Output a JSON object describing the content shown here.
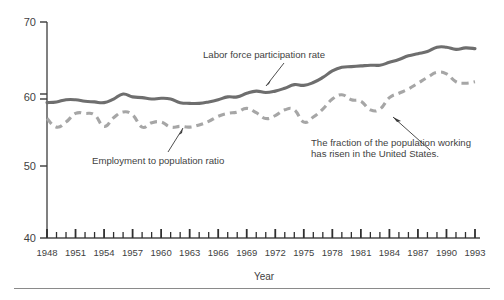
{
  "chart_data": {
    "type": "line",
    "title": "",
    "xlabel": "Year",
    "ylabel": "",
    "xlim": [
      1948,
      1993
    ],
    "ylim": [
      40,
      70
    ],
    "yticks": [
      40,
      50,
      60,
      70
    ],
    "xticks": [
      1948,
      1951,
      1954,
      1957,
      1960,
      1963,
      1966,
      1969,
      1972,
      1975,
      1978,
      1981,
      1984,
      1987,
      1990,
      1993
    ],
    "x_minor_tick_interval": 1,
    "grid": false,
    "legend_position": "none",
    "x": [
      1948,
      1949,
      1950,
      1951,
      1952,
      1953,
      1954,
      1955,
      1956,
      1957,
      1958,
      1959,
      1960,
      1961,
      1962,
      1963,
      1964,
      1965,
      1966,
      1967,
      1968,
      1969,
      1970,
      1971,
      1972,
      1973,
      1974,
      1975,
      1976,
      1977,
      1978,
      1979,
      1980,
      1981,
      1982,
      1983,
      1984,
      1985,
      1986,
      1987,
      1988,
      1989,
      1990,
      1991,
      1992,
      1993
    ],
    "series": [
      {
        "name": "Labor force participation rate",
        "style": "solid",
        "color": "#6e6e6e",
        "values": [
          58.8,
          58.9,
          59.2,
          59.2,
          59.0,
          58.9,
          58.8,
          59.3,
          60.0,
          59.6,
          59.5,
          59.3,
          59.4,
          59.3,
          58.8,
          58.7,
          58.7,
          58.9,
          59.2,
          59.6,
          59.6,
          60.1,
          60.4,
          60.2,
          60.4,
          60.8,
          61.3,
          61.2,
          61.6,
          62.3,
          63.2,
          63.7,
          63.8,
          63.9,
          64.0,
          64.0,
          64.4,
          64.8,
          65.3,
          65.6,
          65.9,
          66.5,
          66.5,
          66.2,
          66.4,
          66.3
        ]
      },
      {
        "name": "Employment to population ratio",
        "style": "dashed",
        "color": "#a6a6a6",
        "values": [
          56.6,
          55.4,
          56.1,
          57.3,
          57.3,
          57.1,
          55.5,
          56.7,
          57.5,
          57.1,
          55.4,
          56.0,
          56.1,
          55.4,
          55.5,
          55.4,
          55.7,
          56.2,
          56.9,
          57.3,
          57.5,
          58.0,
          57.4,
          56.6,
          57.0,
          57.8,
          57.8,
          56.1,
          56.8,
          57.9,
          59.3,
          59.9,
          59.2,
          59.0,
          57.8,
          57.9,
          59.5,
          60.1,
          60.7,
          61.5,
          62.3,
          63.0,
          62.8,
          61.7,
          61.5,
          61.7
        ]
      }
    ],
    "annotations": [
      {
        "id": "labor-force-label",
        "text": "Labor force participation rate",
        "target_series": "Labor force participation rate",
        "target_year": 1969
      },
      {
        "id": "employment-ratio-label",
        "text": "Employment to population ratio",
        "target_series": "Employment to population ratio",
        "target_year": 1962
      },
      {
        "id": "conclusion-note",
        "text_line1": "The fraction of the population working",
        "text_line2": "has risen in the United States.",
        "target_series": "Employment to population ratio",
        "target_year": 1981
      }
    ]
  },
  "axes": {
    "x_axis_title": "Year",
    "y_tick_labels": [
      "70",
      "60",
      "50",
      "40"
    ],
    "x_tick_labels": [
      "1948",
      "1951",
      "1954",
      "1957",
      "1960",
      "1963",
      "1966",
      "1969",
      "1972",
      "1975",
      "1978",
      "1981",
      "1984",
      "1987",
      "1990",
      "1993"
    ]
  },
  "colors": {
    "solid_series": "#6e6e6e",
    "dashed_series": "#a6a6a6",
    "axis": "#4a4a4a",
    "text": "#3f3f3f",
    "background": "#ffffff",
    "footer_rule": "#8a8a8a"
  }
}
